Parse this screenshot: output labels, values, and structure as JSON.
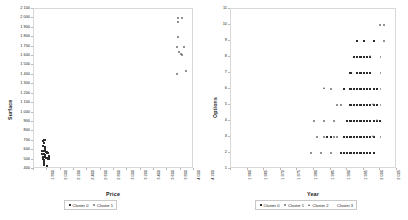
{
  "chart_data": [
    {
      "type": "scatter",
      "title": "",
      "xlabel": "Price",
      "ylabel": "Surface",
      "xlim": [
        1800,
        4200
      ],
      "ylim": [
        400,
        2100
      ],
      "grid": false,
      "legend_position": "bottom",
      "xticks": [
        "1 800",
        "2 000",
        "2 200",
        "2 400",
        "2 600",
        "2 800",
        "3 000",
        "3 200",
        "3 400",
        "3 600",
        "3 800",
        "4 000",
        "4 200"
      ],
      "yticks": [
        "400",
        "500",
        "600",
        "700",
        "800",
        "900",
        "1 000",
        "1 100",
        "1 200",
        "1 300",
        "1 400",
        "1 500",
        "1 600",
        "1 700",
        "1 800",
        "1 900",
        "2 000",
        "2 100"
      ],
      "series": [
        {
          "name": "Cluster 0",
          "marker": "square",
          "color": "#2b2b2b",
          "points": [
            [
              1935,
              700
            ],
            [
              1958,
              705
            ],
            [
              1948,
              672
            ],
            [
              1932,
              640
            ],
            [
              1962,
              628
            ],
            [
              1925,
              596
            ],
            [
              1952,
              590
            ],
            [
              1978,
              582
            ],
            [
              1990,
              578
            ],
            [
              2000,
              575
            ],
            [
              2012,
              572
            ],
            [
              1944,
              556
            ],
            [
              1966,
              548
            ],
            [
              1938,
              530
            ],
            [
              1958,
              524
            ],
            [
              1975,
              520
            ],
            [
              1998,
              516
            ],
            [
              2018,
              512
            ],
            [
              1948,
              498
            ],
            [
              1950,
              486
            ],
            [
              1950,
              474
            ],
            [
              1951,
              462
            ],
            [
              1949,
              450
            ],
            [
              1952,
              440
            ],
            [
              1992,
              436
            ],
            [
              1930,
              512
            ],
            [
              1942,
              588
            ],
            [
              1970,
              606
            ],
            [
              1928,
              560
            ],
            [
              2022,
              540
            ]
          ]
        },
        {
          "name": "Cluster 1",
          "marker": "circle",
          "color": "#6e6e6e",
          "points": [
            [
              3985,
              2115
            ],
            [
              3960,
              2000
            ],
            [
              4022,
              2000
            ],
            [
              3958,
              1962
            ],
            [
              3962,
              1800
            ],
            [
              3948,
              1700
            ],
            [
              4052,
              1700
            ],
            [
              3972,
              1640
            ],
            [
              4005,
              1618
            ],
            [
              4018,
              1615
            ],
            [
              3948,
              1410
            ],
            [
              4080,
              1438
            ]
          ]
        }
      ]
    },
    {
      "type": "scatter",
      "title": "",
      "xlabel": "Year",
      "ylabel": "Options",
      "xlim": [
        1960,
        2010
      ],
      "ylim": [
        1,
        11
      ],
      "grid": false,
      "legend_position": "bottom",
      "xticks": [
        "1 960",
        "1 965",
        "1 970",
        "1 975",
        "1 980",
        "1 985",
        "1 990",
        "1 995",
        "2 000",
        "2 005",
        "2 010"
      ],
      "yticks": [
        "1",
        "2",
        "3",
        "4",
        "5",
        "6",
        "7",
        "8",
        "9",
        "10",
        "11"
      ],
      "series": [
        {
          "name": "Cluster 0",
          "marker": "square",
          "color": "#2b2b2b",
          "points": [
            [
              1998,
              9
            ],
            [
              2000,
              9
            ],
            [
              2003,
              9
            ],
            [
              1997,
              8
            ],
            [
              1998,
              8
            ],
            [
              1999,
              8
            ],
            [
              2000,
              8
            ],
            [
              2001,
              8
            ],
            [
              2002,
              8
            ],
            [
              1996,
              7
            ],
            [
              1998,
              7
            ],
            [
              1999,
              7
            ],
            [
              2000,
              7
            ],
            [
              2001,
              7
            ],
            [
              2002,
              7
            ],
            [
              1994,
              6
            ],
            [
              1996,
              6
            ],
            [
              1997,
              6
            ],
            [
              1998,
              6
            ],
            [
              1999,
              6
            ],
            [
              2000,
              6
            ],
            [
              2001,
              6
            ],
            [
              2002,
              6
            ],
            [
              2003,
              6
            ],
            [
              2004,
              6
            ],
            [
              1996,
              5
            ],
            [
              1997,
              5
            ],
            [
              1998,
              5
            ],
            [
              1999,
              5
            ],
            [
              2000,
              5
            ],
            [
              2001,
              5
            ],
            [
              2002,
              5
            ],
            [
              2003,
              5
            ],
            [
              2004,
              5
            ],
            [
              1995,
              4
            ],
            [
              1996,
              4
            ],
            [
              1997,
              4
            ],
            [
              1998,
              4
            ],
            [
              1999,
              4
            ],
            [
              2000,
              4
            ],
            [
              2001,
              4
            ],
            [
              2002,
              4
            ],
            [
              2003,
              4
            ],
            [
              2004,
              4
            ],
            [
              2005,
              4
            ],
            [
              1989,
              3
            ],
            [
              1990,
              3
            ],
            [
              1994,
              3
            ],
            [
              1995,
              3
            ],
            [
              1996,
              3
            ],
            [
              1997,
              3
            ],
            [
              1998,
              3
            ],
            [
              1999,
              3
            ],
            [
              2000,
              3
            ],
            [
              2001,
              3
            ],
            [
              2002,
              3
            ],
            [
              2003,
              3
            ],
            [
              1993,
              2
            ],
            [
              1994,
              2
            ],
            [
              1995,
              2
            ],
            [
              1996,
              2
            ],
            [
              1997,
              2
            ],
            [
              1998,
              2
            ],
            [
              1999,
              2
            ],
            [
              2000,
              2
            ],
            [
              2001,
              2
            ],
            [
              2002,
              2
            ],
            [
              2003,
              2
            ],
            [
              1988,
              1
            ],
            [
              1990,
              1
            ],
            [
              1992,
              1
            ],
            [
              1993,
              1
            ],
            [
              1994,
              1
            ],
            [
              1995,
              1
            ],
            [
              1996,
              1
            ],
            [
              1997,
              1
            ],
            [
              1998,
              1
            ],
            [
              1999,
              1
            ],
            [
              2000,
              1
            ],
            [
              2001,
              1
            ],
            [
              2002,
              1
            ],
            [
              2003,
              1
            ],
            [
              2004,
              1
            ]
          ]
        },
        {
          "name": "Cluster 1",
          "marker": "circle",
          "color": "#6e6e6e",
          "points": [
            [
              1962,
              1
            ],
            [
              1986,
              3
            ],
            [
              1985,
              4
            ],
            [
              1988,
              4
            ],
            [
              1991,
              4
            ],
            [
              1990,
              6
            ],
            [
              1992,
              5
            ],
            [
              1993,
              5
            ],
            [
              1984,
              2
            ],
            [
              1987,
              2
            ],
            [
              1990,
              2
            ],
            [
              1988,
              3
            ],
            [
              1991,
              3
            ],
            [
              1992,
              3
            ],
            [
              2006,
              9
            ],
            [
              2005,
              10
            ],
            [
              2006,
              10
            ]
          ]
        },
        {
          "name": "Cluster 2",
          "marker": "triangle",
          "color": "#555555",
          "points": [
            [
              1999,
              11
            ],
            [
              1988,
              6
            ],
            [
              2002,
              8
            ],
            [
              2003,
              5
            ],
            [
              2003,
              3
            ],
            [
              2004,
              4
            ]
          ]
        },
        {
          "name": "Cluster 3",
          "marker": "plus",
          "color": "#9a9a9a",
          "points": [
            [
              2004,
              9
            ],
            [
              2006,
              9
            ],
            [
              2003,
              8
            ],
            [
              2004,
              8
            ],
            [
              2005,
              8
            ],
            [
              2006,
              8
            ],
            [
              2003,
              7
            ],
            [
              2004,
              7
            ],
            [
              2005,
              7
            ],
            [
              2006,
              7
            ],
            [
              2005,
              6
            ],
            [
              2006,
              6
            ],
            [
              2007,
              6
            ],
            [
              2005,
              5
            ],
            [
              2006,
              5
            ],
            [
              2007,
              5
            ],
            [
              2006,
              4
            ],
            [
              2007,
              4
            ],
            [
              2004,
              3
            ],
            [
              2005,
              3
            ],
            [
              2006,
              3
            ],
            [
              2004,
              2
            ],
            [
              2006,
              2
            ],
            [
              2007,
              2
            ],
            [
              2005,
              1
            ],
            [
              2006,
              1
            ],
            [
              2007,
              1
            ]
          ]
        }
      ]
    }
  ],
  "panels": [
    {
      "name": "price-surface-scatter",
      "xlabel": "Price",
      "ylabel": "Surface",
      "legend": [
        {
          "label": "Cluster 0",
          "marker": "square"
        },
        {
          "label": "Cluster 1",
          "marker": "circle"
        }
      ]
    },
    {
      "name": "year-options-scatter",
      "xlabel": "Year",
      "ylabel": "Options",
      "legend": [
        {
          "label": "Cluster 0",
          "marker": "square"
        },
        {
          "label": "Cluster 1",
          "marker": "circle"
        },
        {
          "label": "Cluster 2",
          "marker": "triangle"
        },
        {
          "label": "Cluster 3",
          "marker": "plus"
        }
      ]
    }
  ]
}
